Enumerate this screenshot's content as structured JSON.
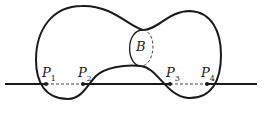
{
  "diagram": {
    "region_label": "B",
    "points": [
      {
        "name": "P",
        "sub": "1"
      },
      {
        "name": "P",
        "sub": "2"
      },
      {
        "name": "P",
        "sub": "3"
      },
      {
        "name": "P",
        "sub": "4"
      }
    ],
    "colors": {
      "stroke": "#1a1a1a",
      "background": "#ffffff"
    }
  }
}
